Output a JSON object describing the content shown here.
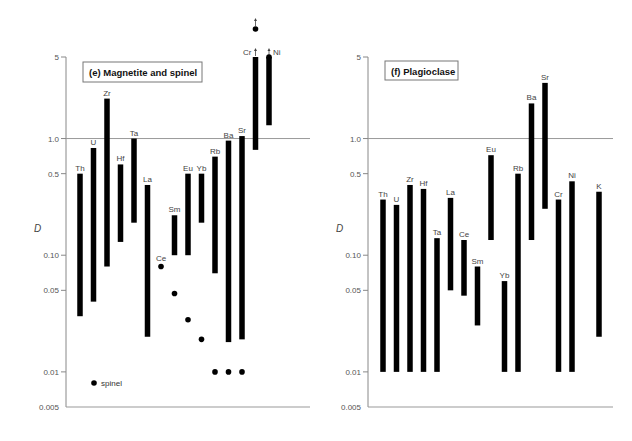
{
  "chart_data": [
    {
      "type": "bar",
      "subtype": "floating-range-log",
      "title": "(e) Magnetite and spinel",
      "xlabel": "",
      "ylabel": "D",
      "yscale": "log",
      "ylim": [
        0.005,
        5
      ],
      "yticks": [
        {
          "value": 5,
          "label": "5"
        },
        {
          "value": 1.0,
          "label": "1.0"
        },
        {
          "value": 0.5,
          "label": "0.5"
        },
        {
          "value": 0.1,
          "label": "0.10"
        },
        {
          "value": 0.05,
          "label": "0.05"
        },
        {
          "value": 0.01,
          "label": "0.01"
        },
        {
          "value": 0.005,
          "label": "0.005"
        }
      ],
      "reference_line": 1.0,
      "categories": [
        "Th",
        "U",
        "Zr",
        "Hf",
        "Ta",
        "La",
        "Ce",
        "Sm",
        "Eu",
        "Yb",
        "Rb",
        "Ba",
        "Sr",
        "Cr",
        "Ni"
      ],
      "series": [
        {
          "name": "magnetite",
          "kind": "range-bar",
          "ranges": [
            {
              "element": "Th",
              "low": 0.03,
              "high": 0.5
            },
            {
              "element": "U",
              "low": 0.04,
              "high": 0.83
            },
            {
              "element": "Zr",
              "low": 0.08,
              "high": 2.2
            },
            {
              "element": "Hf",
              "low": 0.13,
              "high": 0.6
            },
            {
              "element": "Ta",
              "low": 0.19,
              "high": 1.0
            },
            {
              "element": "La",
              "low": 0.02,
              "high": 0.4
            },
            {
              "element": "Ce",
              "low": null,
              "high": null
            },
            {
              "element": "Sm",
              "low": 0.1,
              "high": 0.22
            },
            {
              "element": "Eu",
              "low": 0.1,
              "high": 0.5
            },
            {
              "element": "Yb",
              "low": 0.19,
              "high": 0.5
            },
            {
              "element": "Rb",
              "low": 0.07,
              "high": 0.7
            },
            {
              "element": "Ba",
              "low": 0.018,
              "high": 0.96
            },
            {
              "element": "Sr",
              "low": 0.019,
              "high": 1.05
            },
            {
              "element": "Cr",
              "low": 0.8,
              "high": 5,
              "arrow_up": true
            },
            {
              "element": "Ni",
              "low": 1.3,
              "high": 5,
              "arrow_up": true
            }
          ]
        },
        {
          "name": "spinel",
          "kind": "points",
          "points": [
            {
              "element": "Ce",
              "value": 0.08
            },
            {
              "element": "Sm",
              "value": 0.047
            },
            {
              "element": "Eu",
              "value": 0.028
            },
            {
              "element": "Yb",
              "value": 0.019
            },
            {
              "element": "Rb",
              "value": 0.01
            },
            {
              "element": "Ba",
              "value": 0.01
            },
            {
              "element": "Sr",
              "value": 0.01
            },
            {
              "element": "Cr",
              "value": 10,
              "arrow_up": true,
              "off_scale": true
            },
            {
              "element": "Ni",
              "value": 5,
              "arrow_up": true
            }
          ]
        }
      ],
      "legend": [
        {
          "symbol": "dot",
          "label": "spinel"
        }
      ],
      "legend_position": "bottom-left"
    },
    {
      "type": "bar",
      "subtype": "floating-range-log",
      "title": "(f) Plagioclase",
      "xlabel": "",
      "ylabel": "D",
      "yscale": "log",
      "ylim": [
        0.005,
        5
      ],
      "yticks": [
        {
          "value": 5,
          "label": "5"
        },
        {
          "value": 1.0,
          "label": "1.0"
        },
        {
          "value": 0.5,
          "label": "0.5"
        },
        {
          "value": 0.1,
          "label": "0.10"
        },
        {
          "value": 0.05,
          "label": "0.05"
        },
        {
          "value": 0.01,
          "label": "0.01"
        },
        {
          "value": 0.005,
          "label": "0.005"
        }
      ],
      "reference_line": 1.0,
      "categories": [
        "Th",
        "U",
        "Zr",
        "Hf",
        "Ta",
        "La",
        "Ce",
        "Sm",
        "Eu",
        "Yb",
        "Rb",
        "Ba",
        "Sr",
        "Cr",
        "Ni",
        "K"
      ],
      "series": [
        {
          "name": "plagioclase",
          "kind": "range-bar",
          "ranges": [
            {
              "element": "Th",
              "low": 0.01,
              "high": 0.3
            },
            {
              "element": "U",
              "low": 0.01,
              "high": 0.27
            },
            {
              "element": "Zr",
              "low": 0.01,
              "high": 0.4
            },
            {
              "element": "Hf",
              "low": 0.01,
              "high": 0.37
            },
            {
              "element": "Ta",
              "low": 0.01,
              "high": 0.14
            },
            {
              "element": "La",
              "low": 0.05,
              "high": 0.31
            },
            {
              "element": "Ce",
              "low": 0.045,
              "high": 0.135
            },
            {
              "element": "Sm",
              "low": 0.025,
              "high": 0.08
            },
            {
              "element": "Eu",
              "low": 0.135,
              "high": 0.72
            },
            {
              "element": "Yb",
              "low": 0.01,
              "high": 0.06
            },
            {
              "element": "Rb",
              "low": 0.01,
              "high": 0.5
            },
            {
              "element": "Ba",
              "low": 0.135,
              "high": 2.0
            },
            {
              "element": "Sr",
              "low": 0.25,
              "high": 3.0
            },
            {
              "element": "Cr",
              "low": 0.01,
              "high": 0.3
            },
            {
              "element": "Ni",
              "low": 0.01,
              "high": 0.43
            },
            {
              "element": "K",
              "low": 0.02,
              "high": 0.35
            }
          ]
        }
      ],
      "legend": [],
      "legend_position": "none"
    }
  ]
}
